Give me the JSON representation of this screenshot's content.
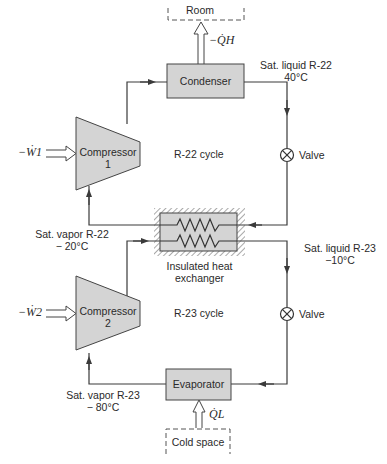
{
  "diagram": {
    "type": "cascade-refrigeration-system",
    "colors": {
      "component_fill": "#d4d4d4",
      "line": "#3a3a3a",
      "background": "#ffffff"
    },
    "top_cycle": {
      "label": "R-22 cycle",
      "room_label": "Room",
      "heat_out_label": "−Q̇H",
      "condenser_label": "Condenser",
      "compressor_label_line1": "Compressor",
      "compressor_label_line2": "1",
      "work_label": "−Ẇ1",
      "valve_label": "Valve",
      "state_condenser_exit_line1": "Sat. liquid R-22",
      "state_condenser_exit_line2": "40°C",
      "state_compressor_inlet_line1": "Sat. vapor R-22",
      "state_compressor_inlet_line2": "− 20°C"
    },
    "heat_exchanger": {
      "label_line1": "Insulated heat",
      "label_line2": "exchanger"
    },
    "bottom_cycle": {
      "label": "R-23 cycle",
      "compressor_label_line1": "Compressor",
      "compressor_label_line2": "2",
      "work_label": "−Ẇ2",
      "valve_label": "Valve",
      "evaporator_label": "Evaporator",
      "heat_in_label": "Q̇L",
      "cold_space_label": "Cold space",
      "state_hx_exit_line1": "Sat. liquid R-23",
      "state_hx_exit_line2": "−10°C",
      "state_compressor_inlet_line1": "Sat. vapor R-23",
      "state_compressor_inlet_line2": "− 80°C"
    }
  }
}
